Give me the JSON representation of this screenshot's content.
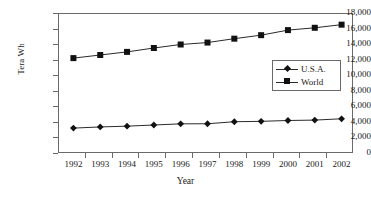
{
  "chart_data": {
    "type": "line",
    "title": "",
    "subtitle": "",
    "xlabel": "Year",
    "ylabel": "Tera Wh",
    "categories": [
      "1992",
      "1993",
      "1994",
      "1995",
      "1996",
      "1997",
      "1998",
      "1999",
      "2000",
      "2001",
      "2002"
    ],
    "x": [
      1992,
      1993,
      1994,
      1995,
      1996,
      1997,
      1998,
      1999,
      2000,
      2001,
      2002
    ],
    "series": [
      {
        "name": "U.S.A.",
        "marker": "diamond",
        "color": "#111111",
        "values": [
          3200,
          3350,
          3450,
          3600,
          3750,
          3760,
          4020,
          4070,
          4180,
          4230,
          4400
        ]
      },
      {
        "name": "World",
        "marker": "square",
        "color": "#111111",
        "values": [
          12200,
          12600,
          13000,
          13500,
          13950,
          14200,
          14700,
          15150,
          15800,
          16100,
          16500
        ]
      }
    ],
    "ylim": [
      0,
      18000
    ],
    "ytick_step": 2000,
    "ytick_labels": [
      "18,000",
      "16,000",
      "14,000",
      "12,000",
      "10,000",
      "8,000",
      "6,000",
      "4,000",
      "2,000",
      "0"
    ],
    "ytick_values": [
      18000,
      16000,
      14000,
      12000,
      10000,
      8000,
      6000,
      4000,
      2000,
      0
    ],
    "grid": false,
    "legend_position": "center-right",
    "frame": true,
    "axis_color": "#6a6a6a",
    "line_color": "#2a2a2a",
    "marker_color": "#111111",
    "background": "#ffffff"
  },
  "legend": {
    "entries": [
      {
        "label": "U.S.A.",
        "marker": "diamond-marker-icon"
      },
      {
        "label": "World",
        "marker": "square-marker-icon"
      }
    ]
  }
}
